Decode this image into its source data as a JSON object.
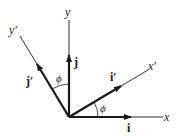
{
  "diagram": {
    "title": "",
    "colors": {
      "ink": "#1a1a1a",
      "background": "#ffffff"
    },
    "axes": [
      {
        "id": "x",
        "label": "x"
      },
      {
        "id": "y",
        "label": "y"
      },
      {
        "id": "x_prime",
        "label": "x′"
      },
      {
        "id": "y_prime",
        "label": "y′"
      }
    ],
    "unit_vectors": [
      {
        "id": "i",
        "label": "i"
      },
      {
        "id": "j",
        "label": "j"
      },
      {
        "id": "i_prime",
        "label": "i′"
      },
      {
        "id": "j_prime",
        "label": "j′"
      }
    ],
    "angles": [
      {
        "id": "phi_x",
        "label": "ϕ",
        "between": "x and x′"
      },
      {
        "id": "phi_y",
        "label": "ϕ",
        "between": "y and y′"
      }
    ]
  }
}
